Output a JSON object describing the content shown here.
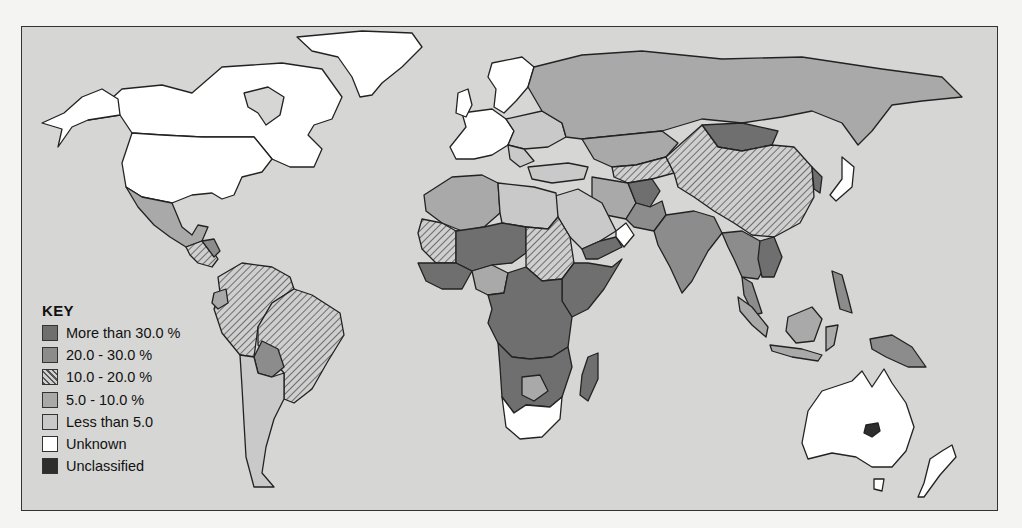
{
  "map": {
    "title": "",
    "ocean_color": "#d6d6d4",
    "categories": {
      "gt30": {
        "label": "More than 30.0 %",
        "fill": "#6f6f6f",
        "pattern": false
      },
      "c20_30": {
        "label": "20.0 - 30.0 %",
        "fill": "#8c8c8c",
        "pattern": false
      },
      "c10_20": {
        "label": "10.0 - 20.0 %",
        "fill": "#a4a4a4",
        "pattern": true
      },
      "c5_10": {
        "label": "5.0 - 10.0 %",
        "fill": "#a9a9a9",
        "pattern": false
      },
      "lt5": {
        "label": "Less than 5.0",
        "fill": "#c9c9c9",
        "pattern": false
      },
      "unknown": {
        "label": "Unknown",
        "fill": "#ffffff",
        "pattern": false
      },
      "uncl": {
        "label": "Unclassified",
        "fill": "#2e2e2e",
        "pattern": false
      }
    },
    "regions": [
      {
        "name": "Canada",
        "category": "unknown"
      },
      {
        "name": "United States",
        "category": "unknown"
      },
      {
        "name": "Greenland",
        "category": "unknown"
      },
      {
        "name": "Mexico",
        "category": "c5_10"
      },
      {
        "name": "Central America",
        "category": "c10_20"
      },
      {
        "name": "Guatemala/Honduras",
        "category": "c20_30"
      },
      {
        "name": "Brazil",
        "category": "c10_20"
      },
      {
        "name": "Colombia/Venezuela/Peru",
        "category": "c10_20"
      },
      {
        "name": "Ecuador",
        "category": "c5_10"
      },
      {
        "name": "Bolivia",
        "category": "c20_30"
      },
      {
        "name": "Argentina/Chile",
        "category": "lt5"
      },
      {
        "name": "Uruguay",
        "category": "lt5"
      },
      {
        "name": "Western Europe",
        "category": "unknown"
      },
      {
        "name": "Eastern Europe",
        "category": "lt5"
      },
      {
        "name": "Russia",
        "category": "c5_10"
      },
      {
        "name": "Kazakhstan",
        "category": "c5_10"
      },
      {
        "name": "Mongolia",
        "category": "gt30"
      },
      {
        "name": "China",
        "category": "c10_20"
      },
      {
        "name": "Afghanistan",
        "category": "gt30"
      },
      {
        "name": "Iran",
        "category": "c5_10"
      },
      {
        "name": "Pakistan",
        "category": "c20_30"
      },
      {
        "name": "India",
        "category": "c20_30"
      },
      {
        "name": "Southeast Asia",
        "category": "c20_30"
      },
      {
        "name": "Cambodia/Vietnam",
        "category": "gt30"
      },
      {
        "name": "Indonesia",
        "category": "c5_10"
      },
      {
        "name": "Philippines",
        "category": "c20_30"
      },
      {
        "name": "Papua New Guinea",
        "category": "c20_30"
      },
      {
        "name": "Japan",
        "category": "unknown"
      },
      {
        "name": "North Africa",
        "category": "lt5"
      },
      {
        "name": "Morocco/Algeria",
        "category": "c5_10"
      },
      {
        "name": "Saudi Arabia",
        "category": "lt5"
      },
      {
        "name": "Yemen",
        "category": "gt30"
      },
      {
        "name": "Sudan",
        "category": "c10_20"
      },
      {
        "name": "Sahel",
        "category": "gt30"
      },
      {
        "name": "Mauritania",
        "category": "c10_20"
      },
      {
        "name": "Nigeria",
        "category": "c5_10"
      },
      {
        "name": "Central & East Africa",
        "category": "gt30"
      },
      {
        "name": "Southern Africa",
        "category": "gt30"
      },
      {
        "name": "Botswana",
        "category": "c5_10"
      },
      {
        "name": "South Africa",
        "category": "unknown"
      },
      {
        "name": "Madagascar",
        "category": "gt30"
      },
      {
        "name": "Australia",
        "category": "unknown"
      },
      {
        "name": "New Zealand",
        "category": "unknown"
      }
    ]
  },
  "legend": {
    "title": "KEY",
    "items": [
      {
        "key": "gt30",
        "label": "More than 30.0 %"
      },
      {
        "key": "c20_30",
        "label": "20.0 - 30.0 %"
      },
      {
        "key": "c10_20",
        "label": "10.0 - 20.0 %"
      },
      {
        "key": "c5_10",
        "label": "5.0 - 10.0 %"
      },
      {
        "key": "lt5",
        "label": "Less than 5.0"
      },
      {
        "key": "unknown",
        "label": "Unknown"
      },
      {
        "key": "uncl",
        "label": "Unclassified"
      }
    ]
  }
}
